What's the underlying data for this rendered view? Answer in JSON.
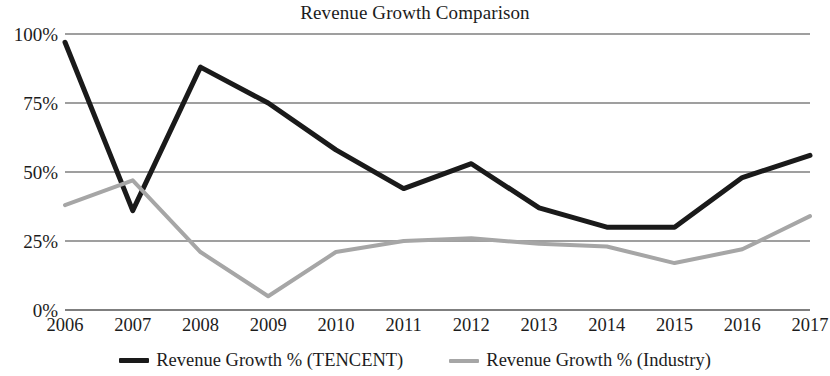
{
  "chart_data": {
    "type": "line",
    "title": "Revenue Growth Comparison",
    "xlabel": "",
    "ylabel": "",
    "x": [
      "2006",
      "2007",
      "2008",
      "2009",
      "2010",
      "2011",
      "2012",
      "2013",
      "2014",
      "2015",
      "2016",
      "2017"
    ],
    "categories": [
      "2006",
      "2007",
      "2008",
      "2009",
      "2010",
      "2011",
      "2012",
      "2013",
      "2014",
      "2015",
      "2016",
      "2017"
    ],
    "ylim": [
      0,
      100
    ],
    "yticks": [
      0,
      25,
      50,
      75,
      100
    ],
    "ytick_labels": [
      "0%",
      "25%",
      "50%",
      "75%",
      "100%"
    ],
    "grid": true,
    "grid_axis": "y",
    "legend_position": "bottom",
    "series": [
      {
        "name": "Revenue Growth % (TENCENT)",
        "color": "#1a1a1a",
        "width": 5,
        "values": [
          97,
          36,
          88,
          75,
          58,
          44,
          53,
          37,
          30,
          30,
          48,
          56
        ]
      },
      {
        "name": "Revenue Growth % (Industry)",
        "color": "#a6a6a6",
        "width": 4,
        "values": [
          38,
          47,
          21,
          5,
          21,
          25,
          26,
          24,
          23,
          17,
          22,
          34
        ]
      }
    ]
  },
  "legend": {
    "items": [
      {
        "label": "Revenue Growth % (TENCENT)",
        "color": "#1a1a1a"
      },
      {
        "label": "Revenue Growth % (Industry)",
        "color": "#a6a6a6"
      }
    ]
  },
  "axes": {
    "grid_color": "#7f7f7f",
    "text_color": "#1c1c1c"
  }
}
